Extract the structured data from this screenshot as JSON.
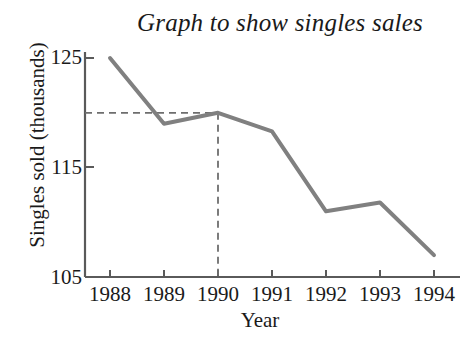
{
  "chart_data": {
    "type": "line",
    "title": "Graph to show singles sales",
    "xlabel": "Year",
    "ylabel": "Singles sold (thousands)",
    "categories": [
      "1988",
      "1989",
      "1990",
      "1991",
      "1992",
      "1993",
      "1994"
    ],
    "values": [
      125,
      119,
      120,
      118.3,
      111,
      111.8,
      107
    ],
    "series": [
      {
        "name": "Singles sold",
        "values": [
          125,
          119,
          120,
          118.3,
          111,
          111.8,
          107
        ],
        "color": "#808080"
      }
    ],
    "ylim": [
      105,
      125
    ],
    "yticks": [
      105,
      115,
      125
    ],
    "ytick_labels": [
      "105",
      "115",
      "125"
    ],
    "xtick_labels": [
      "1988",
      "1989",
      "1990",
      "1991",
      "1992",
      "1993",
      "1994"
    ],
    "grid": false,
    "legend": false,
    "annotations": [
      {
        "name": "guide-horizontal-dashed",
        "type": "dashed-line",
        "orientation": "horizontal",
        "value": 120,
        "from_x": "axis",
        "to_x": "1990"
      },
      {
        "name": "guide-vertical-dashed",
        "type": "dashed-line",
        "orientation": "vertical",
        "value": "1990",
        "from_y": 105,
        "to_y": 120
      }
    ],
    "colors": {
      "line": "#808080",
      "axis": "#5a5a5a",
      "guide": "#6e6e6e",
      "text": "#1a1a1a",
      "background": "#ffffff"
    }
  }
}
